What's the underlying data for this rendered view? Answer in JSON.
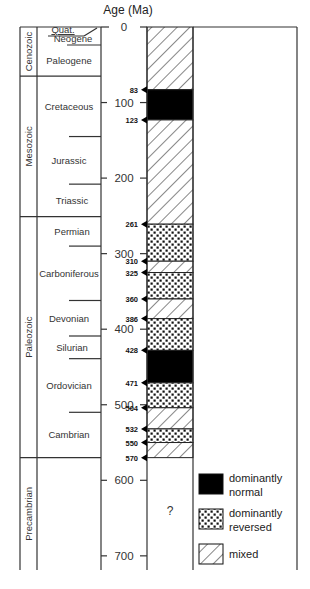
{
  "title": "Age (Ma)",
  "scale": {
    "y0": 27,
    "px_per_ma": 0.7555,
    "max_age": 720
  },
  "axis": {
    "ticks": [
      {
        "value": 0,
        "label": "0"
      },
      {
        "value": 100,
        "label": "100"
      },
      {
        "value": 200,
        "label": "200"
      },
      {
        "value": 300,
        "label": "300"
      },
      {
        "value": 400,
        "label": "400"
      },
      {
        "value": 500,
        "label": "500"
      },
      {
        "value": 600,
        "label": "600"
      },
      {
        "value": 700,
        "label": "700"
      }
    ]
  },
  "eras": [
    {
      "name": "Cenozoic",
      "start": 0,
      "end": 65
    },
    {
      "name": "Mesozoic",
      "start": 65,
      "end": 251
    },
    {
      "name": "Paleozoic",
      "start": 251,
      "end": 570
    },
    {
      "name": "Precambrian",
      "start": 570,
      "end": 720
    }
  ],
  "periods": [
    {
      "name": "Quat.",
      "start": 0,
      "end": 2
    },
    {
      "name": "Neogene",
      "start": 2,
      "end": 23
    },
    {
      "name": "Paleogene",
      "start": 23,
      "end": 65
    },
    {
      "name": "Cretaceous",
      "start": 65,
      "end": 145
    },
    {
      "name": "Jurassic",
      "start": 145,
      "end": 208
    },
    {
      "name": "Triassic",
      "start": 208,
      "end": 251
    },
    {
      "name": "Permian",
      "start": 251,
      "end": 290
    },
    {
      "name": "Carboniferous",
      "start": 290,
      "end": 362
    },
    {
      "name": "Devonian",
      "start": 362,
      "end": 409
    },
    {
      "name": "Silurian",
      "start": 409,
      "end": 439
    },
    {
      "name": "Ordovician",
      "start": 439,
      "end": 510
    },
    {
      "name": "Cambrian",
      "start": 510,
      "end": 570
    }
  ],
  "polarity_intervals": [
    {
      "start": 0,
      "end": 83,
      "type": "mixed"
    },
    {
      "start": 83,
      "end": 123,
      "type": "normal"
    },
    {
      "start": 123,
      "end": 261,
      "type": "mixed"
    },
    {
      "start": 261,
      "end": 310,
      "type": "reversed"
    },
    {
      "start": 310,
      "end": 325,
      "type": "mixed"
    },
    {
      "start": 325,
      "end": 360,
      "type": "reversed"
    },
    {
      "start": 360,
      "end": 386,
      "type": "mixed"
    },
    {
      "start": 386,
      "end": 428,
      "type": "reversed"
    },
    {
      "start": 428,
      "end": 471,
      "type": "normal"
    },
    {
      "start": 471,
      "end": 504,
      "type": "reversed"
    },
    {
      "start": 504,
      "end": 532,
      "type": "mixed"
    },
    {
      "start": 532,
      "end": 550,
      "type": "reversed"
    },
    {
      "start": 550,
      "end": 570,
      "type": "mixed"
    }
  ],
  "boundaries": [
    83,
    123,
    261,
    310,
    325,
    360,
    386,
    428,
    471,
    504,
    532,
    550,
    570
  ],
  "unknown_label": "?",
  "legend": [
    {
      "type": "normal",
      "line1": "dominantly",
      "line2": "normal"
    },
    {
      "type": "reversed",
      "line1": "dominantly",
      "line2": "reversed"
    },
    {
      "type": "mixed",
      "line1": "mixed",
      "line2": ""
    }
  ],
  "colors": {
    "normal": "#000000",
    "line": "#333333",
    "background": "#ffffff"
  }
}
